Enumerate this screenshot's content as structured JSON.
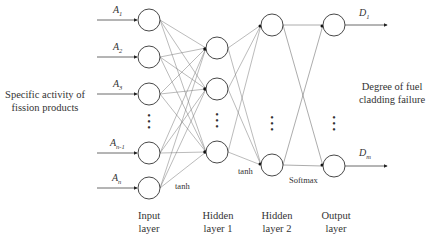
{
  "diagram": {
    "type": "neural-network",
    "input_description": "Specific activity of fission products",
    "output_description": "Degree of fuel cladding failure",
    "inputs": [
      {
        "symbol": "A",
        "sub": "1"
      },
      {
        "symbol": "A",
        "sub": "2"
      },
      {
        "symbol": "A",
        "sub": "3"
      },
      {
        "symbol": "A",
        "sub": "n-1"
      },
      {
        "symbol": "A",
        "sub": "n"
      }
    ],
    "outputs": [
      {
        "symbol": "D",
        "sub": "1"
      },
      {
        "symbol": "D",
        "sub": "m"
      }
    ],
    "activations": {
      "input_to_hidden1": "tanh",
      "hidden1_to_hidden2": "tanh",
      "hidden2_to_output": "Softmax"
    },
    "layers": [
      {
        "name": "Input",
        "line1": "Input",
        "line2": "layer",
        "visible_nodes": 5
      },
      {
        "name": "Hidden layer 1",
        "line1": "Hidden",
        "line2": "layer 1",
        "visible_nodes": 3
      },
      {
        "name": "Hidden layer 2",
        "line1": "Hidden",
        "line2": "layer 2",
        "visible_nodes": 2
      },
      {
        "name": "Output",
        "line1": "Output",
        "line2": "layer",
        "visible_nodes": 2
      }
    ],
    "ellipsis": "⋮"
  }
}
